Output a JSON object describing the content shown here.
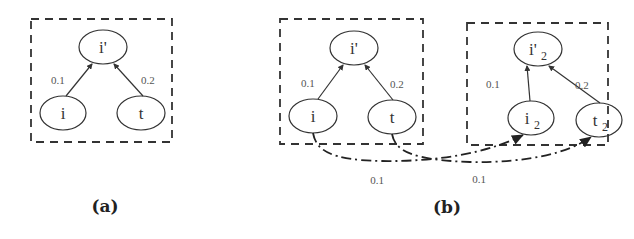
{
  "figure": {
    "panel_a": {
      "caption": "(a)",
      "nodes": {
        "top": "i'",
        "left": "i",
        "right": "t"
      },
      "edges": [
        {
          "from": "i",
          "to": "i'",
          "weight": "0.1"
        },
        {
          "from": "t",
          "to": "i'",
          "weight": "0.2"
        }
      ]
    },
    "panel_b": {
      "caption": "(b)",
      "left_box": {
        "nodes": {
          "top": "i'",
          "left": "i",
          "right": "t"
        },
        "edges": [
          {
            "from": "i",
            "to": "i'",
            "weight": "0.1"
          },
          {
            "from": "t",
            "to": "i'",
            "weight": "0.2"
          }
        ]
      },
      "right_box": {
        "nodes": {
          "top": "i'",
          "top_sub": "2",
          "left": "i",
          "left_sub": "2",
          "right": "t",
          "right_sub": "2"
        },
        "edges": [
          {
            "from": "i2",
            "to": "i'2",
            "weight": "0.1"
          },
          {
            "from": "t2",
            "to": "i'2",
            "weight": "0.2"
          }
        ]
      },
      "cross_edges": [
        {
          "from": "i",
          "to": "i2",
          "weight": "0.1"
        },
        {
          "from": "t",
          "to": "t2",
          "weight": "0.1"
        }
      ]
    }
  }
}
